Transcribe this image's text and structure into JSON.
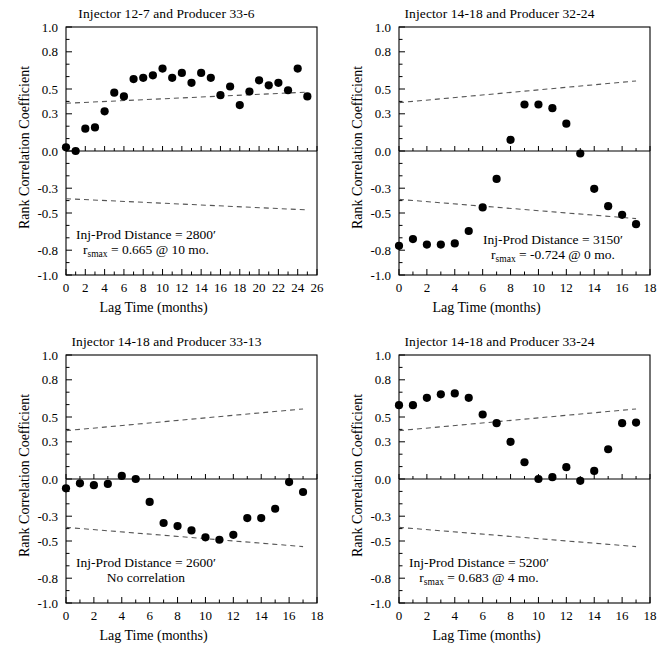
{
  "figure": {
    "axis_label_y": "Rank Correlation Coefficient",
    "axis_label_x": "Lag Time (months)",
    "ylim": [
      -1.0,
      1.0
    ],
    "ytick_labels": [
      "1.0",
      "0.8",
      "0.5",
      "0.3",
      "0.0",
      "-0.3",
      "-0.5",
      "-0.8",
      "-1.0"
    ],
    "ytick_values": [
      1.0,
      0.8,
      0.5,
      0.3,
      0.0,
      -0.3,
      -0.5,
      -0.8,
      -1.0
    ],
    "marker_color": "#000000",
    "ci_line_color": "#555555"
  },
  "chart_data": [
    {
      "type": "scatter",
      "panel": "top-left",
      "title": "Injector 12-7 and Producer 33-6",
      "xlabel": "Lag Time (months)",
      "ylabel": "Rank Correlation Coefficient",
      "xlim": [
        0,
        26
      ],
      "ylim": [
        -1.0,
        1.0
      ],
      "xtick_labels": [
        "0",
        "2",
        "4",
        "6",
        "8",
        "10",
        "12",
        "14",
        "16",
        "18",
        "20",
        "22",
        "24",
        "26"
      ],
      "xtick_values": [
        0,
        2,
        4,
        6,
        8,
        10,
        12,
        14,
        16,
        18,
        20,
        22,
        24,
        26
      ],
      "grid": false,
      "legend": "none",
      "x": [
        0,
        1,
        2,
        3,
        4,
        5,
        6,
        7,
        8,
        9,
        10,
        11,
        12,
        13,
        14,
        15,
        16,
        17,
        18,
        19,
        20,
        21,
        22,
        23,
        24,
        25
      ],
      "values": [
        0.03,
        0.0,
        0.18,
        0.19,
        0.32,
        0.47,
        0.44,
        0.58,
        0.59,
        0.61,
        0.665,
        0.59,
        0.63,
        0.55,
        0.63,
        0.59,
        0.45,
        0.52,
        0.37,
        0.48,
        0.57,
        0.53,
        0.55,
        0.49,
        0.665,
        0.44
      ],
      "upper_ci": [
        [
          0,
          0.385
        ],
        [
          25,
          0.475
        ]
      ],
      "lower_ci": [
        [
          0,
          -0.385
        ],
        [
          25,
          -0.475
        ]
      ],
      "annotation_line1": "Inj-Prod Distance = 2800′",
      "annotation_line2_prefix": "r",
      "annotation_line2_sub": "smax",
      "annotation_line2_rest": " = 0.665 @ 10 mo.",
      "inj_prod_distance": "2800′",
      "rsmax": 0.665,
      "rsmax_lag_months": 10
    },
    {
      "type": "scatter",
      "panel": "top-right",
      "title": "Injector 14-18 and Producer 32-24",
      "xlabel": "Lag Time (months)",
      "ylabel": "Rank Correlation Coefficient",
      "xlim": [
        0,
        18
      ],
      "ylim": [
        -1.0,
        1.0
      ],
      "xtick_labels": [
        "0",
        "2",
        "4",
        "6",
        "8",
        "10",
        "12",
        "14",
        "16",
        "18"
      ],
      "xtick_values": [
        0,
        2,
        4,
        6,
        8,
        10,
        12,
        14,
        16,
        18
      ],
      "grid": false,
      "legend": "none",
      "x": [
        0,
        1,
        2,
        3,
        4,
        5,
        6,
        7,
        8,
        9,
        10,
        11,
        12,
        13,
        14,
        15,
        16,
        17
      ],
      "values": [
        -0.765,
        -0.71,
        -0.755,
        -0.755,
        -0.745,
        -0.645,
        -0.455,
        -0.225,
        0.09,
        0.375,
        0.375,
        0.345,
        0.22,
        -0.02,
        -0.305,
        -0.445,
        -0.515,
        -0.59
      ],
      "upper_ci": [
        [
          0,
          0.39
        ],
        [
          17,
          0.565
        ]
      ],
      "lower_ci": [
        [
          0,
          -0.39
        ],
        [
          17,
          -0.545
        ]
      ],
      "annotation_line1": "Inj-Prod Distance = 3150′",
      "annotation_line2_prefix": "r",
      "annotation_line2_sub": "smax",
      "annotation_line2_rest": " = -0.724 @ 0 mo.",
      "inj_prod_distance": "3150′",
      "rsmax": -0.724,
      "rsmax_lag_months": 0
    },
    {
      "type": "scatter",
      "panel": "bottom-left",
      "title": "Injector 14-18 and Producer 33-13",
      "xlabel": "Lag Time (months)",
      "ylabel": "Rank Correlation Coefficient",
      "xlim": [
        0,
        18
      ],
      "ylim": [
        -1.0,
        1.0
      ],
      "xtick_labels": [
        "0",
        "2",
        "4",
        "6",
        "8",
        "10",
        "12",
        "14",
        "16",
        "18"
      ],
      "xtick_values": [
        0,
        2,
        4,
        6,
        8,
        10,
        12,
        14,
        16,
        18
      ],
      "grid": false,
      "legend": "none",
      "x": [
        0,
        1,
        2,
        3,
        4,
        5,
        6,
        7,
        8,
        9,
        10,
        11,
        12,
        13,
        14,
        15,
        16,
        17
      ],
      "values": [
        -0.075,
        -0.035,
        -0.05,
        -0.04,
        0.025,
        0.0,
        -0.185,
        -0.355,
        -0.38,
        -0.415,
        -0.47,
        -0.49,
        -0.45,
        -0.315,
        -0.315,
        -0.24,
        -0.025,
        -0.105
      ],
      "upper_ci": [
        [
          0,
          0.39
        ],
        [
          17,
          0.565
        ]
      ],
      "lower_ci": [
        [
          0,
          -0.39
        ],
        [
          17,
          -0.545
        ]
      ],
      "annotation_line1": "Inj-Prod Distance = 2600′",
      "annotation_line2_plain": "No correlation",
      "inj_prod_distance": "2600′",
      "rsmax": null,
      "rsmax_lag_months": null
    },
    {
      "type": "scatter",
      "panel": "bottom-right",
      "title": "Injector 14-18 and Producer 33-24",
      "xlabel": "Lag Time (months)",
      "ylabel": "Rank Correlation Coefficient",
      "xlim": [
        0,
        18
      ],
      "ylim": [
        -1.0,
        1.0
      ],
      "xtick_labels": [
        "0",
        "2",
        "4",
        "6",
        "8",
        "10",
        "12",
        "14",
        "16",
        "18"
      ],
      "xtick_values": [
        0,
        2,
        4,
        6,
        8,
        10,
        12,
        14,
        16,
        18
      ],
      "grid": false,
      "legend": "none",
      "x": [
        0,
        1,
        2,
        3,
        4,
        5,
        6,
        7,
        8,
        9,
        10,
        11,
        12,
        13,
        14,
        15,
        16,
        17
      ],
      "values": [
        0.595,
        0.595,
        0.655,
        0.683,
        0.69,
        0.655,
        0.52,
        0.45,
        0.3,
        0.135,
        0.0,
        0.015,
        0.095,
        -0.015,
        0.065,
        0.24,
        0.45,
        0.455
      ],
      "upper_ci": [
        [
          0,
          0.39
        ],
        [
          17,
          0.565
        ]
      ],
      "lower_ci": [
        [
          0,
          -0.39
        ],
        [
          17,
          -0.545
        ]
      ],
      "annotation_line1": "Inj-Prod Distance = 5200′",
      "annotation_line2_prefix": "r",
      "annotation_line2_sub": "smax",
      "annotation_line2_rest": " = 0.683 @ 4 mo.",
      "inj_prod_distance": "5200′",
      "rsmax": 0.683,
      "rsmax_lag_months": 4
    }
  ]
}
